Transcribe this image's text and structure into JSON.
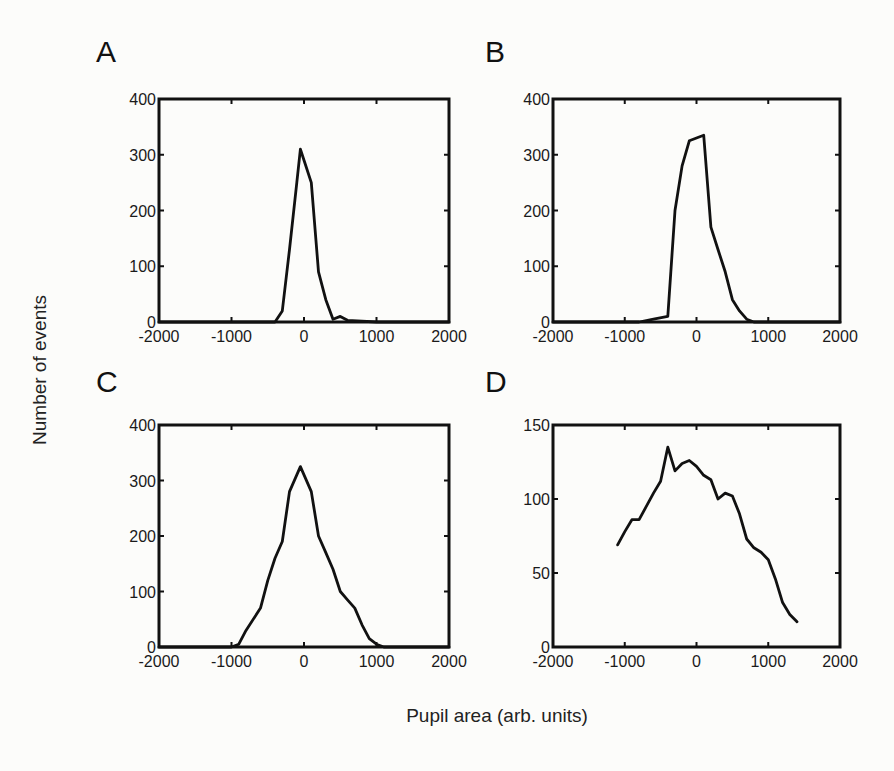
{
  "figure": {
    "ylabel": "Number of events",
    "xlabel": "Pupil area (arb. units)"
  },
  "chart_data": [
    {
      "panel": "A",
      "type": "line",
      "title": "",
      "xlabel": "Pupil area (arb. units)",
      "ylabel": "Number of events",
      "xlim": [
        -2000,
        2000
      ],
      "ylim": [
        0,
        400
      ],
      "xticks": [
        -2000,
        -1000,
        0,
        1000,
        2000
      ],
      "yticks": [
        0,
        100,
        200,
        300,
        400
      ],
      "grid": false,
      "legend": null,
      "x": [
        -2000,
        -1000,
        -400,
        -300,
        -200,
        -100,
        -50,
        0,
        100,
        200,
        300,
        400,
        500,
        600,
        1000,
        2000
      ],
      "values": [
        0,
        0,
        0,
        20,
        130,
        250,
        310,
        290,
        250,
        90,
        40,
        5,
        10,
        3,
        0,
        0
      ]
    },
    {
      "panel": "B",
      "type": "line",
      "title": "",
      "xlabel": "Pupil area (arb. units)",
      "ylabel": "Number of events",
      "xlim": [
        -2000,
        2000
      ],
      "ylim": [
        0,
        400
      ],
      "xticks": [
        -2000,
        -1000,
        0,
        1000,
        2000
      ],
      "yticks": [
        0,
        100,
        200,
        300,
        400
      ],
      "grid": false,
      "legend": null,
      "x": [
        -2000,
        -800,
        -600,
        -400,
        -300,
        -200,
        -100,
        0,
        100,
        200,
        300,
        400,
        500,
        600,
        700,
        800,
        2000
      ],
      "values": [
        0,
        0,
        5,
        10,
        200,
        280,
        325,
        330,
        335,
        170,
        130,
        90,
        40,
        20,
        5,
        0,
        0
      ]
    },
    {
      "panel": "C",
      "type": "line",
      "title": "",
      "xlabel": "Pupil area (arb. units)",
      "ylabel": "Number of events",
      "xlim": [
        -2000,
        2000
      ],
      "ylim": [
        0,
        400
      ],
      "xticks": [
        -2000,
        -1000,
        0,
        1000,
        2000
      ],
      "yticks": [
        0,
        100,
        200,
        300,
        400
      ],
      "grid": false,
      "legend": null,
      "x": [
        -2000,
        -1000,
        -900,
        -800,
        -600,
        -500,
        -400,
        -300,
        -200,
        -100,
        -50,
        0,
        100,
        200,
        300,
        400,
        500,
        600,
        700,
        800,
        900,
        1000,
        1100,
        2000
      ],
      "values": [
        0,
        0,
        5,
        30,
        70,
        120,
        160,
        190,
        280,
        310,
        325,
        310,
        280,
        200,
        170,
        140,
        100,
        85,
        70,
        40,
        15,
        5,
        0,
        0
      ]
    },
    {
      "panel": "D",
      "type": "line",
      "title": "",
      "xlabel": "Pupil area (arb. units)",
      "ylabel": "Number of events",
      "xlim": [
        -2000,
        2000
      ],
      "ylim": [
        0,
        150
      ],
      "xticks": [
        -2000,
        -1000,
        0,
        1000,
        2000
      ],
      "yticks": [
        0,
        50,
        100,
        150
      ],
      "grid": false,
      "legend": null,
      "x": [
        -1100,
        -1000,
        -900,
        -800,
        -700,
        -600,
        -500,
        -400,
        -300,
        -200,
        -100,
        0,
        100,
        200,
        300,
        400,
        500,
        600,
        700,
        800,
        900,
        1000,
        1100,
        1200,
        1300,
        1400
      ],
      "values": [
        69,
        78,
        86,
        86,
        95,
        104,
        112,
        135,
        119,
        124,
        126,
        122,
        116,
        113,
        100,
        104,
        102,
        90,
        73,
        67,
        64,
        59,
        46,
        30,
        22,
        17
      ]
    }
  ]
}
